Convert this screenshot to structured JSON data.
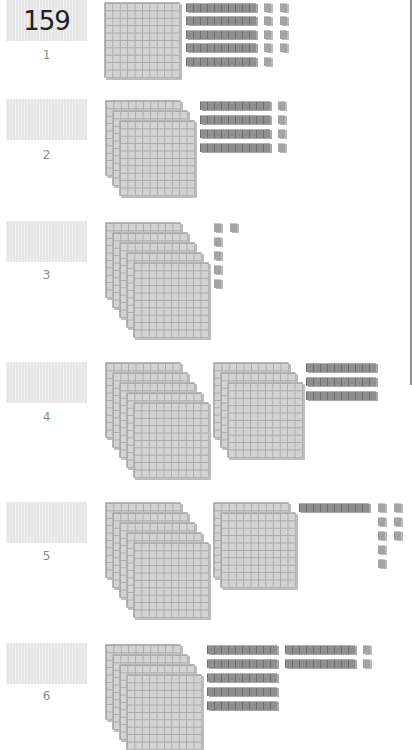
{
  "worksheet": {
    "problems": [
      {
        "number": "1",
        "answer": "159",
        "hundreds": 1,
        "tens": 5,
        "ones": 9
      },
      {
        "number": "2",
        "answer": "",
        "hundreds": 3,
        "tens": 4,
        "ones": 4
      },
      {
        "number": "3",
        "answer": "",
        "hundreds": 5,
        "tens": 0,
        "ones": 6
      },
      {
        "number": "4",
        "answer": "",
        "hundreds": 8,
        "tens": 3,
        "ones": 0
      },
      {
        "number": "5",
        "answer": "",
        "hundreds": 7,
        "tens": 1,
        "ones": 8
      },
      {
        "number": "6",
        "answer": "",
        "hundreds": 4,
        "tens": 7,
        "ones": 2
      }
    ]
  }
}
